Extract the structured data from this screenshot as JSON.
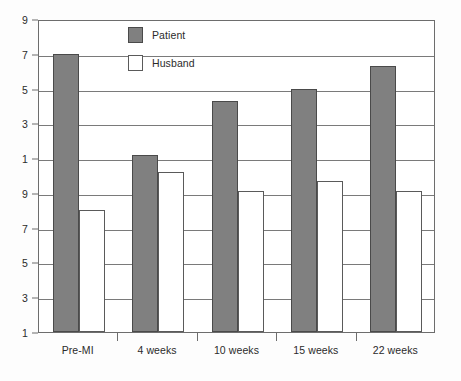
{
  "chart_data": {
    "type": "bar",
    "title": "",
    "xlabel": "",
    "ylabel": "",
    "categories": [
      "Pre-MI",
      "4 weeks",
      "10 weeks",
      "15 weeks",
      "22 weeks"
    ],
    "series": [
      {
        "name": "Patient",
        "color": "#808080",
        "values": [
          17.0,
          11.2,
          14.3,
          15.0,
          16.3
        ]
      },
      {
        "name": "Husband",
        "color": "#ffffff",
        "values": [
          8.0,
          10.2,
          9.1,
          9.7,
          9.1
        ]
      }
    ],
    "ylim": [
      1,
      19
    ],
    "ytick_values": [
      19,
      17,
      15,
      13,
      11,
      9,
      7,
      5,
      3,
      1
    ],
    "ytick_labels": [
      "9",
      "7",
      "5",
      "3",
      "1",
      "9",
      "7",
      "5",
      "3",
      "1"
    ],
    "grid": true,
    "legend_position": "top-center"
  },
  "legend": {
    "entries": [
      {
        "label": "Patient"
      },
      {
        "label": "Husband"
      }
    ]
  }
}
